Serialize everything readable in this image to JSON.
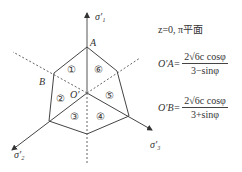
{
  "diagram": {
    "axes": {
      "sigma1": "σ′₁",
      "sigma2": "σ′₂",
      "sigma3": "σ′₃"
    },
    "points": {
      "A": "A",
      "B": "B",
      "origin": "O′"
    },
    "regions": [
      "①",
      "②",
      "③",
      "④",
      "⑤",
      "⑥"
    ],
    "condition": "z=0, π平面",
    "formulas": [
      {
        "lhs": "O′A=",
        "numerator": "2√6c cosφ",
        "denominator": "3−sinφ"
      },
      {
        "lhs": "O′B=",
        "numerator": "2√6c cosφ",
        "denominator": "3+sinφ"
      }
    ]
  }
}
